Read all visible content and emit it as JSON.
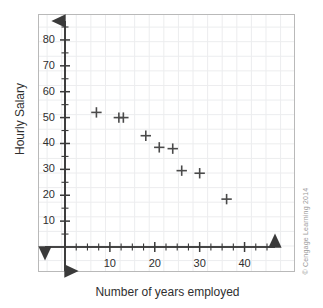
{
  "figure": {
    "attribution": "© Cengage Learning 2014",
    "border_color": "#b9b9b9",
    "grid_color": "#e9eaec",
    "axis_color": "#3a3a3a",
    "marker_color": "#4a4a4a",
    "background": "#ffffff"
  },
  "chart_data": {
    "type": "scatter",
    "title": "",
    "xlabel": "Number of years employed",
    "ylabel": "Hourly Salary",
    "xlim": [
      0,
      45
    ],
    "ylim": [
      0,
      85
    ],
    "grid": true,
    "legend": "none",
    "marker": "plus",
    "x_major_ticks": [
      10,
      20,
      30,
      40
    ],
    "x_tick_labels": [
      "10",
      "20",
      "30",
      "40"
    ],
    "x_minor_step": 2.5,
    "y_major_ticks": [
      10,
      20,
      30,
      40,
      50,
      60,
      70,
      80
    ],
    "y_tick_labels": [
      "10",
      "20",
      "30",
      "40",
      "50",
      "60",
      "70",
      "80"
    ],
    "y_minor_step": 5,
    "axis_arrows": "both-ends",
    "points": [
      {
        "x": 7,
        "y": 52
      },
      {
        "x": 12,
        "y": 50
      },
      {
        "x": 13,
        "y": 50
      },
      {
        "x": 18,
        "y": 43
      },
      {
        "x": 21,
        "y": 38.5
      },
      {
        "x": 24,
        "y": 38
      },
      {
        "x": 26,
        "y": 29.5
      },
      {
        "x": 30,
        "y": 28.5
      },
      {
        "x": 36,
        "y": 18.5
      }
    ],
    "n_points": 9,
    "note": "Two markers overlap near x=12 and x=13 at y=50"
  }
}
